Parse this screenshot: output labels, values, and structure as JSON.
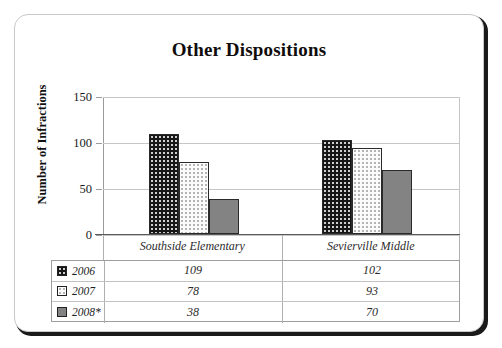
{
  "chart_data": {
    "type": "bar",
    "title": "Other Dispositions",
    "xlabel": "",
    "ylabel": "Number of Infractions",
    "ylim": [
      0,
      150
    ],
    "yticks": [
      0,
      50,
      100,
      150
    ],
    "ytick_labels": [
      "0",
      "50",
      "100",
      "150"
    ],
    "grid": true,
    "legend_position": "table-below",
    "categories": [
      "Southside Elementary",
      "Sevierville Middle"
    ],
    "series": [
      {
        "name": "2006",
        "values": [
          109,
          102
        ],
        "color": "#171717",
        "pattern": "dotted-dark"
      },
      {
        "name": "2007",
        "values": [
          78,
          93
        ],
        "color": "#fbfbfb",
        "pattern": "dotted-light"
      },
      {
        "name": "2008*",
        "values": [
          38,
          70
        ],
        "color": "#838383",
        "pattern": "solid"
      }
    ]
  },
  "card": {
    "border_color": "#c9c9c9",
    "shadow_color": "#1a1a1a"
  },
  "table": {
    "row_labels": [
      "2006",
      "2007",
      "2008*"
    ],
    "columns": [
      "Southside Elementary",
      "Sevierville Middle"
    ],
    "cells": [
      [
        "109",
        "102"
      ],
      [
        "78",
        "93"
      ],
      [
        "38",
        "70"
      ]
    ]
  }
}
